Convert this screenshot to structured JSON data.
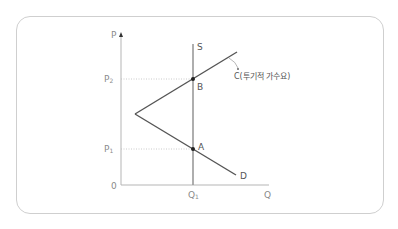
{
  "diagram": {
    "type": "supply-demand with speculative demand",
    "axes": {
      "y_label": "P",
      "x_label": "Q",
      "origin_label": "0"
    },
    "price_levels": [
      {
        "label": "P",
        "subscript": "2",
        "point": "B"
      },
      {
        "label": "P",
        "subscript": "1",
        "point": "A"
      }
    ],
    "quantity_levels": [
      {
        "label": "Q",
        "subscript": "1"
      }
    ],
    "curves": {
      "supply": "S",
      "demand": "D",
      "speculative": "C(투기적 가수요)"
    },
    "points": {
      "upper": "B",
      "lower": "A"
    },
    "colors": {
      "axis": "#b5b5b5",
      "curve": "#555555",
      "supply": "#9a9a9a",
      "guide": "#bdbdbd",
      "frame": "#cfcfcf",
      "point": "#222222"
    }
  }
}
